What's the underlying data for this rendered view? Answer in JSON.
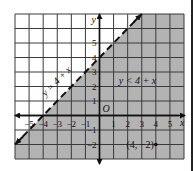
{
  "chart_data": {
    "type": "inequality-graph",
    "xlim": [
      -6,
      6
    ],
    "ylim": [
      -3,
      7
    ],
    "grid": true,
    "axes": {
      "xlabel": "x",
      "ylabel": "y",
      "origin_label": "O"
    },
    "x_ticks": [
      {
        "value": -5,
        "label": "−5"
      },
      {
        "value": -4,
        "label": "−4"
      },
      {
        "value": -3,
        "label": "−3"
      },
      {
        "value": -2,
        "label": "−2"
      },
      {
        "value": -1,
        "label": "−1"
      },
      {
        "value": 1,
        "label": "1"
      },
      {
        "value": 2,
        "label": "2"
      },
      {
        "value": 3,
        "label": "3"
      },
      {
        "value": 4,
        "label": "4"
      },
      {
        "value": 5,
        "label": "5"
      }
    ],
    "y_ticks": [
      {
        "value": 5,
        "label": "5"
      },
      {
        "value": 4,
        "label": "4"
      },
      {
        "value": 3,
        "label": "3"
      },
      {
        "value": 2,
        "label": "2"
      },
      {
        "value": 1,
        "label": "1"
      },
      {
        "value": -1,
        "label": "−1"
      },
      {
        "value": -2,
        "label": "−2"
      }
    ],
    "boundary": {
      "equation": "y = 4 + x",
      "slope": 1,
      "intercept": 4,
      "style": "dashed",
      "from": [
        -6,
        -2
      ],
      "to": [
        3,
        7
      ]
    },
    "shaded_region": {
      "inequality": "y < 4 + x",
      "side": "below",
      "color": "#b3b3b3"
    },
    "points": [
      {
        "x": 4,
        "y": -2,
        "label": "(4, −2)"
      }
    ],
    "annotations": [
      {
        "text": "y = 4 + x",
        "x": -2.9,
        "y": 2.2,
        "rotate": -45
      },
      {
        "text": "y < 4 + x",
        "x": 2.7,
        "y": 2.2
      }
    ]
  },
  "colors": {
    "grid": "#3a3a3a",
    "axis": "#111111",
    "shade": "#b3b3b3",
    "background": "#ffffff"
  }
}
